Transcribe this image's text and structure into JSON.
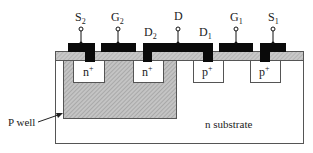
{
  "diagram": {
    "type": "CMOS cross-section",
    "terminals": {
      "s2": {
        "label": "S",
        "sub": "2"
      },
      "g2": {
        "label": "G",
        "sub": "2"
      },
      "d2": {
        "label": "D",
        "sub": "2"
      },
      "d": {
        "label": "D",
        "sub": ""
      },
      "d1": {
        "label": "D",
        "sub": "1"
      },
      "g1": {
        "label": "G",
        "sub": "1"
      },
      "s1": {
        "label": "S",
        "sub": "1"
      }
    },
    "regions": {
      "n_plus_left": {
        "label": "n",
        "sup": "+"
      },
      "n_plus_right": {
        "label": "n",
        "sup": "+"
      },
      "p_plus_left": {
        "label": "p",
        "sup": "+"
      },
      "p_plus_right": {
        "label": "p",
        "sup": "+"
      },
      "p_well": "P well",
      "substrate": "n substrate"
    },
    "colors": {
      "metal": "#0a0a0a",
      "oxide": "#bdbdbd",
      "p_well": "#b8b8b8",
      "outline": "#555555",
      "background": "#ffffff"
    }
  }
}
